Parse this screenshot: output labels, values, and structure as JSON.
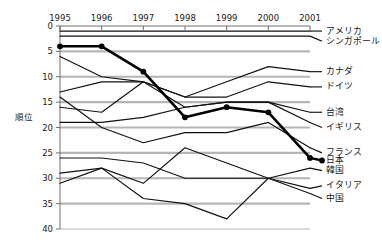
{
  "chart_data": {
    "type": "line",
    "title": "",
    "xlabel": "",
    "ylabel": "順位",
    "x": [
      1995,
      1996,
      1997,
      1998,
      1999,
      2000,
      2001
    ],
    "xtick_labels": [
      "1995",
      "1996",
      "1997",
      "1998",
      "1999",
      "2000",
      "2001"
    ],
    "ytick_labels": [
      "0",
      "5",
      "10",
      "15",
      "20",
      "25",
      "30",
      "35",
      "40"
    ],
    "yticks": [
      0,
      5,
      10,
      15,
      20,
      25,
      30,
      35,
      40
    ],
    "ylim": [
      0,
      40
    ],
    "y_inverted": true,
    "grid": "horizontal",
    "legend_position": "right-edge-labels",
    "series": [
      {
        "name": "アメリカ",
        "values": [
          1,
          1,
          1,
          1,
          1,
          1,
          1
        ],
        "highlight": false,
        "markers": false,
        "label_y": 1
      },
      {
        "name": "シンガポール",
        "values": [
          2,
          2,
          2,
          2,
          2,
          2,
          2
        ],
        "highlight": false,
        "markers": false,
        "label_y": 3
      },
      {
        "name": "カナダ",
        "values": [
          6,
          10,
          11,
          14,
          11,
          8,
          9
        ],
        "highlight": false,
        "markers": false,
        "label_y": 9
      },
      {
        "name": "ドイツ",
        "values": [
          13,
          11,
          11,
          14,
          14,
          11,
          12
        ],
        "highlight": false,
        "markers": false,
        "label_y": 12
      },
      {
        "name": "台湾",
        "values": [
          16,
          17,
          11,
          16,
          15,
          15,
          17
        ],
        "highlight": false,
        "markers": false,
        "label_y": 17
      },
      {
        "name": "イギリス",
        "values": [
          19,
          19,
          18,
          16,
          15,
          15,
          19
        ],
        "highlight": false,
        "markers": false,
        "label_y": 20
      },
      {
        "name": "フランス",
        "values": [
          14,
          20,
          23,
          21,
          21,
          19,
          24
        ],
        "highlight": false,
        "markers": false,
        "label_y": 25
      },
      {
        "name": "日本",
        "values": [
          4,
          4,
          9,
          18,
          16,
          17,
          26
        ],
        "highlight": true,
        "markers": true,
        "label_y": 26.5
      },
      {
        "name": "韓国",
        "values": [
          26,
          26,
          27,
          30,
          30,
          30,
          28
        ],
        "highlight": false,
        "markers": false,
        "label_y": 28.5
      },
      {
        "name": "イタリア",
        "values": [
          29,
          28,
          31,
          24,
          27,
          30,
          32
        ],
        "highlight": false,
        "markers": false,
        "label_y": 31.5
      },
      {
        "name": "中国",
        "values": [
          31,
          28,
          34,
          35,
          38,
          30,
          33
        ],
        "highlight": false,
        "markers": false,
        "label_y": 34
      }
    ],
    "colors": {
      "line": "#111111",
      "highlight_line": "#000000",
      "grid": "#b5b5b5",
      "axis": "#6e6e6e",
      "text": "#1a1a1a",
      "background": "#ffffff"
    }
  }
}
